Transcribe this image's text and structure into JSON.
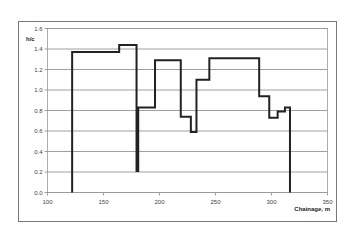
{
  "chart_data": {
    "type": "line",
    "style": "step",
    "title": "",
    "xlabel": "Chainage, m",
    "ylabel": "h/c",
    "xlim": [
      100,
      350
    ],
    "ylim": [
      0.0,
      1.6
    ],
    "x_ticks": [
      100,
      150,
      200,
      250,
      300,
      350
    ],
    "y_ticks": [
      0.0,
      0.2,
      0.4,
      0.6,
      0.8,
      1.0,
      1.2,
      1.4,
      1.6
    ],
    "x_tick_labels": [
      "100",
      "150",
      "200",
      "250",
      "300",
      "350"
    ],
    "y_tick_labels": [
      "0.0",
      "0.2",
      "0.4",
      "0.6",
      "0.8",
      "1.0",
      "1.2",
      "1.4",
      "1.6"
    ],
    "grid": {
      "horizontal": true,
      "vertical": false
    },
    "legend": null,
    "series": [
      {
        "name": "h/c",
        "color": "#222222",
        "points": [
          [
            122,
            0.0
          ],
          [
            122,
            1.37
          ],
          [
            164,
            1.37
          ],
          [
            164,
            1.44
          ],
          [
            179.5,
            1.44
          ],
          [
            179.5,
            0.21
          ],
          [
            181,
            0.21
          ],
          [
            181,
            0.83
          ],
          [
            196,
            0.83
          ],
          [
            196,
            1.29
          ],
          [
            219,
            1.29
          ],
          [
            219,
            0.74
          ],
          [
            228,
            0.74
          ],
          [
            228,
            0.59
          ],
          [
            233,
            0.59
          ],
          [
            233,
            1.1
          ],
          [
            244.5,
            1.1
          ],
          [
            244.5,
            1.31
          ],
          [
            289,
            1.31
          ],
          [
            289,
            0.94
          ],
          [
            298,
            0.94
          ],
          [
            298,
            0.73
          ],
          [
            305.5,
            0.73
          ],
          [
            305.5,
            0.79
          ],
          [
            312,
            0.79
          ],
          [
            312,
            0.83
          ],
          [
            316.5,
            0.83
          ],
          [
            316.5,
            0.0
          ]
        ]
      }
    ]
  }
}
